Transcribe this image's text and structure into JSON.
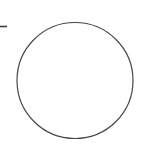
{
  "canvas": {
    "width": 142,
    "height": 146,
    "background_color": "#ffffff",
    "title": "Circle Outline"
  },
  "figure": {
    "type": "line-drawing",
    "shapes": [
      {
        "name": "circle-outline",
        "kind": "circle",
        "center_x": 75,
        "center_y": 80.5,
        "radius": 58,
        "stroke_color": "#474747",
        "stroke_width": 1.2,
        "fill": "none"
      },
      {
        "name": "left-edge-tick",
        "kind": "horizontal-line",
        "x1": 0,
        "y1": 26.5,
        "x2": 7,
        "y2": 26.5,
        "stroke_color": "#3a3a3a",
        "stroke_width": 1.6
      }
    ]
  }
}
